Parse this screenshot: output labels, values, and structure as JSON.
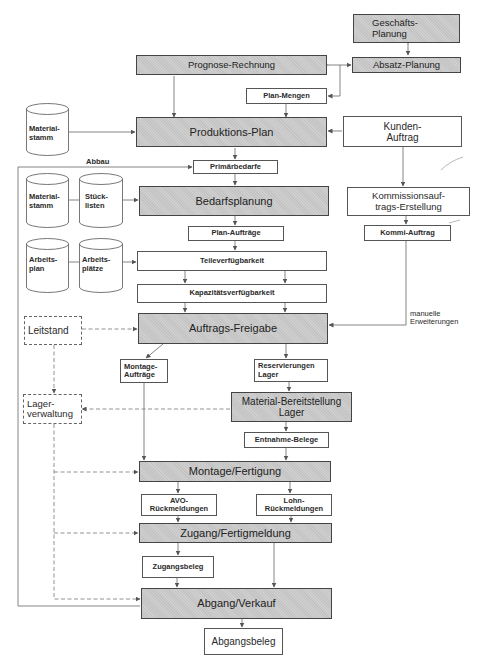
{
  "diagram": {
    "processes": {
      "geschaefts_planung": "Geschäfts-\nPlanung",
      "absatz_planung": "Absatz-Planung",
      "prognose_rechnung": "Prognose-Rechnung",
      "produktions_plan": "Produktions-Plan",
      "bedarfsplanung": "Bedarfsplanung",
      "auftrags_freigabe": "Auftrags-Freigabe",
      "material_bereitstellung": "Material-Bereitstellung\nLager",
      "montage_fertigung": "Montage/Fertigung",
      "zugang_fertigmeldung": "Zugang/Fertigmeldung",
      "abgang_verkauf": "Abgang/Verkauf"
    },
    "documents": {
      "plan_mengen": "Plan-Mengen",
      "kunden_auftrag": "Kunden-\nAuftrag",
      "primaerbedarfe": "Primärbedarfe",
      "kommissionsauftrags_erstellung": "Kommissionsauf-\ntrags-Erstellung",
      "plan_auftraege": "Plan-Aufträge",
      "kommi_auftrag": "Kommi-Auftrag",
      "teileverfuegbarkeit": "Teileverfügbarkeit",
      "kapazitaetsverfuegbarkeit": "Kapazitätsverfügbarkeit",
      "montage_auftraege": "Montage-\nAufträge",
      "reservierungen_lager": "Reservierungen\nLager",
      "entnahme_belege": "Entnahme-Belege",
      "avo_rueckmeldungen": "AVO-\nRückmeldungen",
      "lohn_rueckmeldungen": "Lohn-\nRückmeldungen",
      "zugangsbeleg": "Zugangsbeleg",
      "abgangsbeleg": "Abgangsbeleg"
    },
    "external_systems": {
      "leitstand": "Leitstand",
      "lagerverwaltung": "Lager-\nverwaltung"
    },
    "data_stores": {
      "materialstamm_1": "Material-\nstamm",
      "materialstamm_2": "Material-\nstamm",
      "stuecklisten": "Stück-\nlisten",
      "arbeitsplan": "Arbeits-\nplan",
      "arbeitsplaetze": "Arbeits-\nplätze"
    },
    "annotations": {
      "abbau": "Abbau",
      "manuelle_erweiterungen": "manuelle\nErweiterungen"
    },
    "colors": {
      "process_fill": "#cfcfcf",
      "line": "#555555",
      "text": "#2a2a2a"
    }
  }
}
